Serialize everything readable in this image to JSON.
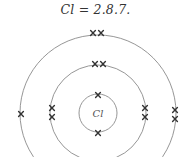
{
  "title": "Cl = 2.8.7.",
  "atom": {
    "symbol": "Cl",
    "configuration": [
      2,
      8,
      7
    ],
    "center": [
      98,
      113
    ],
    "colors": {
      "shell": "#8a8a8a",
      "electron": "#333333",
      "text": "#333333"
    },
    "shells": [
      {
        "name": "inner",
        "radius": 19,
        "electron_count": 2,
        "electrons": [
          [
            98,
            95
          ],
          [
            98,
            133
          ]
        ]
      },
      {
        "name": "middle",
        "radius": 48,
        "electron_count": 8,
        "electrons": [
          [
            95,
            64
          ],
          [
            103,
            64
          ],
          [
            52,
            108
          ],
          [
            52,
            117
          ],
          [
            145,
            108
          ],
          [
            145,
            117
          ]
        ]
      },
      {
        "name": "outer",
        "radius": 78,
        "electron_count": 7,
        "electrons": [
          [
            93,
            33
          ],
          [
            101,
            33
          ],
          [
            21,
            114
          ],
          [
            175,
            110
          ],
          [
            175,
            119
          ]
        ]
      }
    ]
  }
}
